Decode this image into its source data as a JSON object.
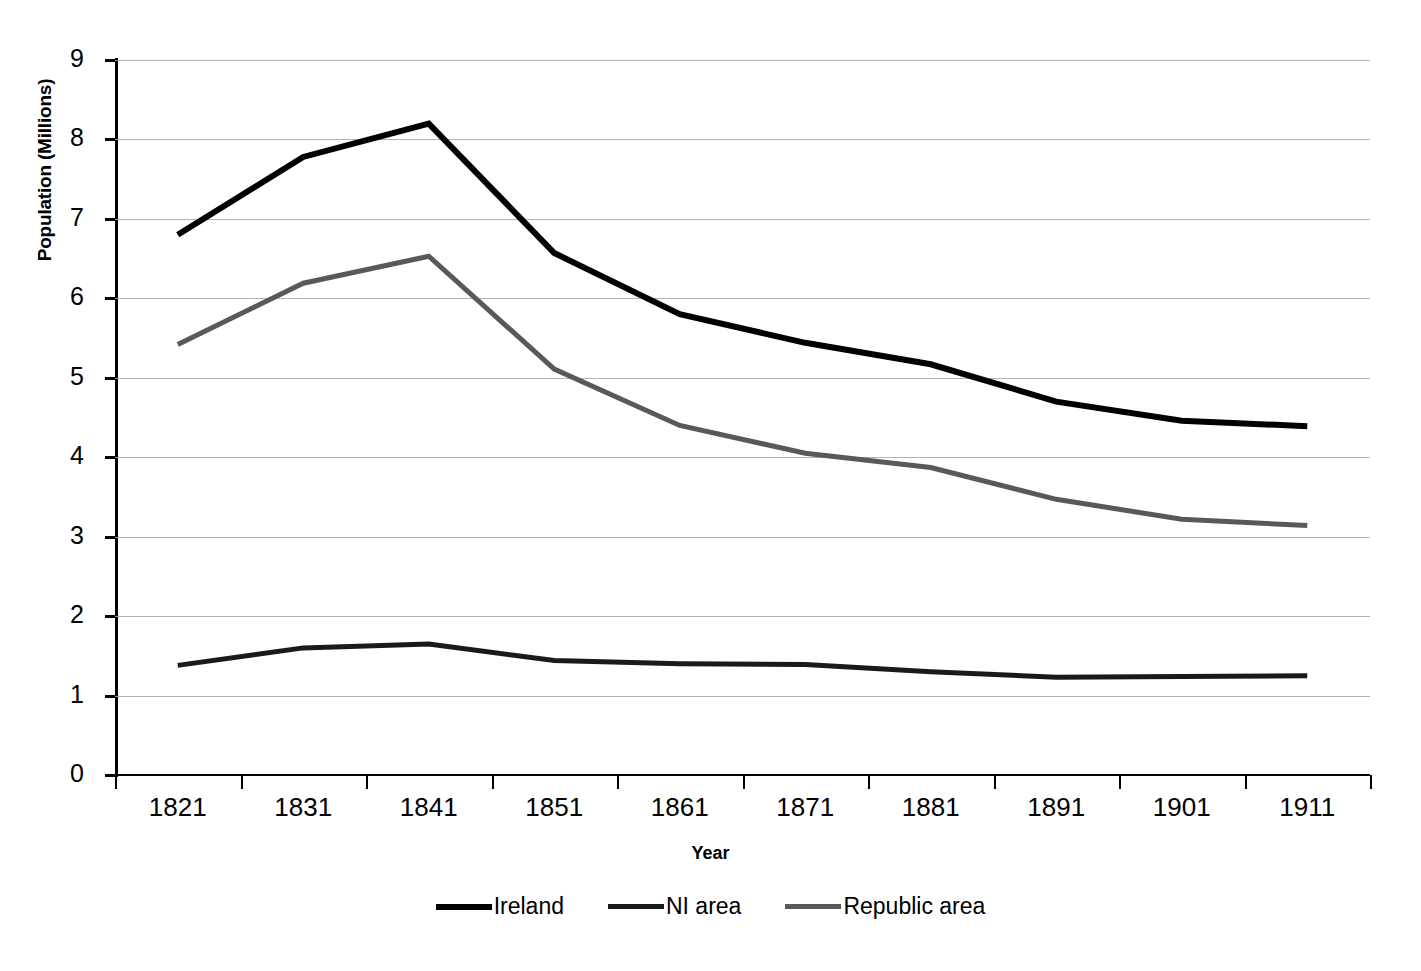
{
  "chart_data": {
    "type": "line",
    "title": "",
    "xlabel": "Year",
    "ylabel": "Population (Millions)",
    "categories": [
      "1821",
      "1831",
      "1841",
      "1851",
      "1861",
      "1871",
      "1881",
      "1891",
      "1901",
      "1911"
    ],
    "x": [
      1821,
      1831,
      1841,
      1851,
      1861,
      1871,
      1881,
      1891,
      1901,
      1911
    ],
    "ylim": [
      0,
      9
    ],
    "yticks": [
      "0",
      "1",
      "2",
      "3",
      "4",
      "5",
      "6",
      "7",
      "8",
      "9"
    ],
    "grid": true,
    "legend_position": "bottom",
    "series": [
      {
        "name": "Ireland",
        "color": "#000000",
        "width": 6,
        "values": [
          6.8,
          7.78,
          8.2,
          6.57,
          5.8,
          5.44,
          5.17,
          4.7,
          4.46,
          4.39
        ]
      },
      {
        "name": "NI area",
        "color": "#1a1a1a",
        "width": 5,
        "values": [
          1.38,
          1.6,
          1.65,
          1.44,
          1.4,
          1.39,
          1.3,
          1.23,
          1.24,
          1.25
        ]
      },
      {
        "name": "Republic area",
        "color": "#595959",
        "width": 5,
        "values": [
          5.42,
          6.19,
          6.53,
          5.11,
          4.4,
          4.05,
          3.87,
          3.47,
          3.22,
          3.14
        ]
      }
    ]
  },
  "axes": {
    "y_title": "Population (Millions)",
    "x_title": "Year",
    "gridline_color": "#a6a6a6",
    "axis_color": "#000000"
  },
  "legend": {
    "items": [
      {
        "label": "Ireland",
        "color": "#000000"
      },
      {
        "label": "NI area",
        "color": "#1a1a1a"
      },
      {
        "label": "Republic area",
        "color": "#595959"
      }
    ]
  }
}
